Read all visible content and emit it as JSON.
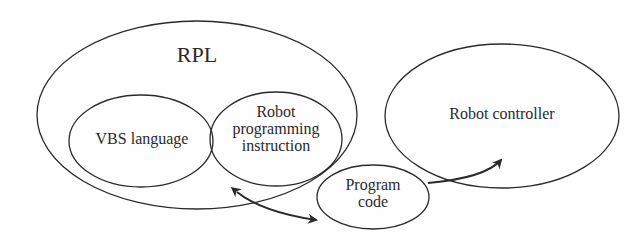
{
  "diagram": {
    "nodes": {
      "rpl": {
        "label": "RPL"
      },
      "vbs": {
        "label": "VBS language"
      },
      "robot_prog": {
        "line1": "Robot",
        "line2": "programming",
        "line3": "instruction"
      },
      "controller": {
        "label": "Robot controller"
      },
      "program_code": {
        "line1": "Program",
        "line2": "code"
      }
    },
    "edges": [
      {
        "from": "RPL",
        "to": "Program code",
        "type": "bidirectional"
      },
      {
        "from": "Program code",
        "to": "Robot controller",
        "type": "directed"
      }
    ],
    "colors": {
      "stroke": "#2a2a2a",
      "background": "#fefefe"
    }
  }
}
